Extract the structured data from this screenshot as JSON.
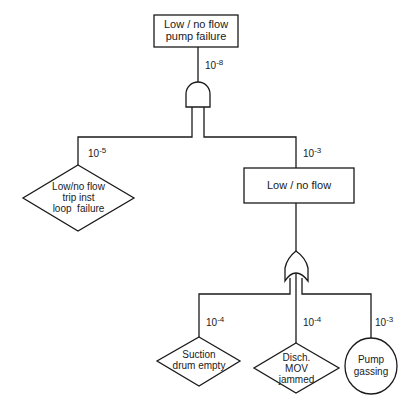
{
  "diagram": {
    "type": "fault-tree",
    "top_event": {
      "label_line1": "Low / no flow",
      "label_line2": "pump failure",
      "probability_base": "10",
      "probability_exp": "-8"
    },
    "top_gate": {
      "type": "AND"
    },
    "left_event": {
      "shape": "diamond",
      "label_line1": "Low/no flow",
      "label_line2": "trip inst",
      "label_line3": "loop  failure",
      "probability_base": "10",
      "probability_exp": "-5"
    },
    "intermediate_event": {
      "label": "Low / no flow",
      "probability_base": "10",
      "probability_exp": "-3"
    },
    "lower_gate": {
      "type": "OR"
    },
    "basic_events": [
      {
        "shape": "diamond",
        "label_line1": "Suction",
        "label_line2": "drum empty",
        "probability_base": "10",
        "probability_exp": "-4"
      },
      {
        "shape": "diamond",
        "label_line1": "Disch.",
        "label_line2": "MOV",
        "label_line3": "jammed",
        "probability_base": "10",
        "probability_exp": "-4"
      },
      {
        "shape": "circle",
        "label_line1": "Pump",
        "label_line2": "gassing",
        "probability_base": "10",
        "probability_exp": "-3"
      }
    ],
    "colors": {
      "line": "#1a1a1a",
      "background": "#ffffff"
    }
  }
}
